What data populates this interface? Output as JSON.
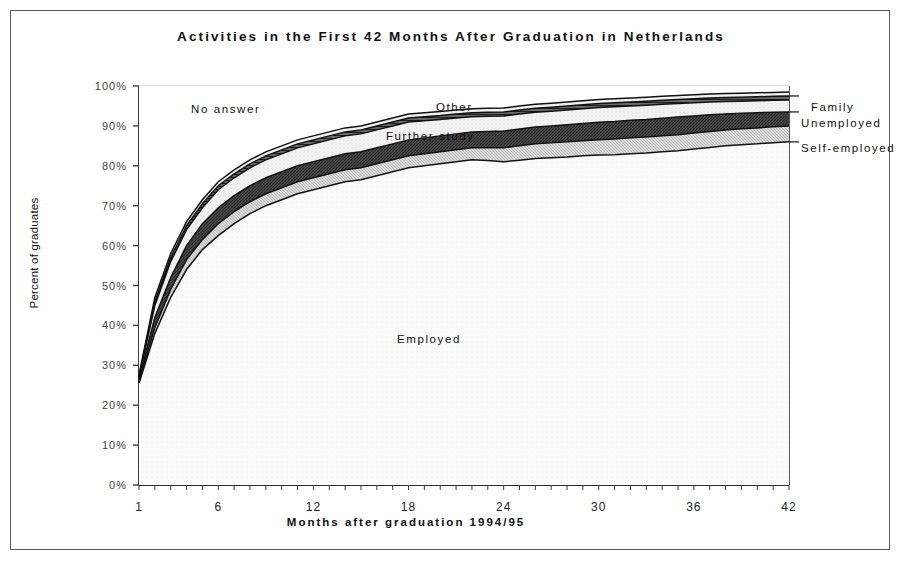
{
  "figure": {
    "title": "Activities in the First 42 Months After Graduation in Netherlands",
    "x_axis_title": "Months after graduation 1994/95",
    "y_axis_title": "Percent of graduates"
  },
  "labels": {
    "no_answer": "No answer",
    "other": "Other",
    "further_study": "Further study",
    "employed": "Employed",
    "family": "Family",
    "unemployed": "Unemployed",
    "self_employed": "Self-employed"
  },
  "chart_data": {
    "type": "area",
    "title": "Activities in the First 42 Months After Graduation in Netherlands",
    "xlabel": "Months after graduation 1994/95",
    "ylabel": "Percent of graduates",
    "xlim": [
      1,
      42
    ],
    "ylim": [
      0,
      100
    ],
    "grid": false,
    "legend_position": "inline-annotations",
    "stacked": true,
    "x_ticks": [
      1,
      6,
      12,
      18,
      24,
      30,
      36,
      42
    ],
    "x_tick_labels": [
      "1",
      "6",
      "12",
      "18",
      "24",
      "30",
      "36",
      "42"
    ],
    "x_minor_tick_interval": 1,
    "y_ticks": [
      0,
      10,
      20,
      30,
      40,
      50,
      60,
      70,
      80,
      90,
      100
    ],
    "y_tick_labels": [
      "0%",
      "10%",
      "20%",
      "30%",
      "40%",
      "50%",
      "60%",
      "70%",
      "80%",
      "90%",
      "100%"
    ],
    "x": [
      1,
      2,
      3,
      4,
      5,
      6,
      7,
      8,
      9,
      10,
      11,
      12,
      13,
      14,
      15,
      16,
      17,
      18,
      19,
      20,
      21,
      22,
      23,
      24,
      25,
      26,
      27,
      28,
      29,
      30,
      31,
      32,
      33,
      34,
      35,
      36,
      37,
      38,
      39,
      40,
      41,
      42
    ],
    "cumulative_series": [
      {
        "name": "Employed",
        "note": "cumulative top of Employed band",
        "values": [
          25.5,
          38.0,
          47.0,
          54.0,
          59.0,
          62.5,
          65.5,
          68.0,
          70.0,
          71.5,
          73.0,
          74.0,
          75.0,
          76.0,
          76.5,
          77.5,
          78.5,
          79.5,
          80.0,
          80.5,
          81.0,
          81.5,
          81.3,
          81.0,
          81.4,
          81.8,
          82.0,
          82.2,
          82.5,
          82.7,
          82.8,
          83.0,
          83.2,
          83.5,
          83.8,
          84.2,
          84.6,
          85.0,
          85.3,
          85.5,
          85.8,
          86.0
        ]
      },
      {
        "name": "Self-employed",
        "note": "cumulative top of Self-employed band",
        "values": [
          26.0,
          39.5,
          49.0,
          56.5,
          61.5,
          65.5,
          68.5,
          71.0,
          73.0,
          74.5,
          76.0,
          77.0,
          78.0,
          79.0,
          79.5,
          80.5,
          81.5,
          82.5,
          83.0,
          83.5,
          84.0,
          84.5,
          84.5,
          84.5,
          85.0,
          85.5,
          85.8,
          86.0,
          86.3,
          86.5,
          86.7,
          87.0,
          87.2,
          87.5,
          87.8,
          88.2,
          88.6,
          89.0,
          89.3,
          89.5,
          89.8,
          90.0
        ]
      },
      {
        "name": "Unemployed",
        "note": "cumulative top of Unemployed band",
        "values": [
          26.6,
          42.0,
          52.0,
          60.0,
          65.5,
          69.5,
          72.5,
          75.0,
          77.0,
          78.5,
          80.0,
          81.0,
          82.0,
          83.0,
          83.5,
          84.5,
          85.5,
          86.5,
          87.0,
          87.5,
          88.0,
          88.5,
          88.6,
          88.7,
          89.2,
          89.7,
          90.0,
          90.3,
          90.6,
          90.9,
          91.1,
          91.4,
          91.6,
          91.9,
          92.2,
          92.5,
          92.8,
          93.0,
          93.2,
          93.3,
          93.4,
          93.5
        ]
      },
      {
        "name": "Further study",
        "note": "cumulative top of Further study band",
        "values": [
          27.0,
          45.0,
          56.0,
          64.0,
          69.5,
          74.0,
          77.0,
          79.5,
          81.5,
          83.0,
          84.5,
          85.5,
          86.5,
          87.5,
          88.0,
          89.0,
          90.0,
          91.0,
          91.3,
          91.6,
          92.0,
          92.3,
          92.4,
          92.5,
          93.0,
          93.4,
          93.7,
          94.0,
          94.3,
          94.6,
          94.8,
          95.0,
          95.2,
          95.4,
          95.6,
          95.8,
          96.0,
          96.1,
          96.2,
          96.3,
          96.4,
          96.5
        ]
      },
      {
        "name": "Family",
        "note": "cumulative top of Family band",
        "values": [
          27.3,
          46.0,
          57.0,
          65.0,
          70.5,
          75.0,
          78.0,
          80.5,
          82.5,
          84.0,
          85.5,
          86.5,
          87.5,
          88.5,
          89.0,
          90.0,
          91.0,
          92.0,
          92.3,
          92.6,
          93.0,
          93.3,
          93.4,
          93.5,
          94.0,
          94.4,
          94.7,
          95.0,
          95.3,
          95.6,
          95.8,
          96.0,
          96.2,
          96.4,
          96.6,
          96.8,
          97.0,
          97.1,
          97.2,
          97.3,
          97.4,
          97.5
        ]
      },
      {
        "name": "Other",
        "note": "cumulative top of Other band",
        "values": [
          27.6,
          47.0,
          58.0,
          66.0,
          71.5,
          76.0,
          79.0,
          81.5,
          83.5,
          85.0,
          86.5,
          87.5,
          88.5,
          89.5,
          90.0,
          91.0,
          92.0,
          93.0,
          93.3,
          93.6,
          94.0,
          94.3,
          94.4,
          94.5,
          95.0,
          95.4,
          95.7,
          96.0,
          96.3,
          96.6,
          96.8,
          97.0,
          97.2,
          97.4,
          97.6,
          97.8,
          98.0,
          98.1,
          98.2,
          98.3,
          98.4,
          98.5
        ]
      },
      {
        "name": "No answer",
        "note": "cumulative top = 100%",
        "values": [
          100,
          100,
          100,
          100,
          100,
          100,
          100,
          100,
          100,
          100,
          100,
          100,
          100,
          100,
          100,
          100,
          100,
          100,
          100,
          100,
          100,
          100,
          100,
          100,
          100,
          100,
          100,
          100,
          100,
          100,
          100,
          100,
          100,
          100,
          100,
          100,
          100,
          100,
          100,
          100,
          100,
          100
        ]
      }
    ]
  }
}
